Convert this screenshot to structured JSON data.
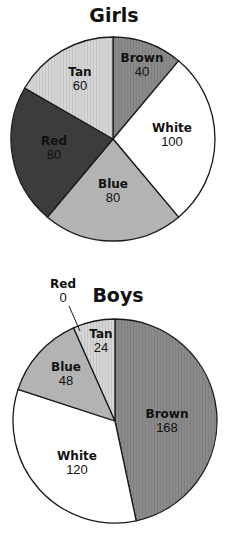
{
  "chart_data": [
    {
      "type": "pie",
      "title": "Girls",
      "start_angle_deg": 0,
      "direction": "clockwise",
      "categories": [
        "Brown",
        "White",
        "Blue",
        "Red",
        "Tan"
      ],
      "values": [
        40,
        100,
        80,
        80,
        60
      ],
      "colors": [
        "#8a8a8a",
        "#ffffff",
        "#b3b3b3",
        "#3c3c3c",
        "#d6d6d6"
      ],
      "geometry": {
        "cx": 113,
        "cy": 139,
        "r": 102,
        "title_x": 114,
        "title_y": 22
      },
      "labels": [
        {
          "name": "Brown",
          "value": "40",
          "x": 142,
          "y": 62
        },
        {
          "name": "White",
          "value": "100",
          "x": 172,
          "y": 132
        },
        {
          "name": "Blue",
          "value": "80",
          "x": 113,
          "y": 188
        },
        {
          "name": "Red",
          "value": "80",
          "x": 54,
          "y": 145
        },
        {
          "name": "Tan",
          "value": "60",
          "x": 80,
          "y": 76
        }
      ]
    },
    {
      "type": "pie",
      "title": "Boys",
      "start_angle_deg": 0,
      "direction": "clockwise",
      "categories": [
        "Brown",
        "White",
        "Blue",
        "Tan",
        "Red"
      ],
      "values": [
        168,
        120,
        48,
        24,
        0
      ],
      "colors": [
        "#8a8a8a",
        "#ffffff",
        "#b3b3b3",
        "#d6d6d6",
        "#3c3c3c"
      ],
      "geometry": {
        "cx": 115,
        "cy": 421,
        "r": 102,
        "title_x": 118,
        "title_y": 302
      },
      "labels": [
        {
          "name": "Brown",
          "value": "168",
          "x": 167,
          "y": 418
        },
        {
          "name": "White",
          "value": "120",
          "x": 77,
          "y": 460
        },
        {
          "name": "Blue",
          "value": "48",
          "x": 66,
          "y": 371
        },
        {
          "name": "Tan",
          "value": "24",
          "x": 101,
          "y": 338
        },
        {
          "name": "Red",
          "value": "0",
          "x": 63,
          "y": 288,
          "leader": [
            69,
            306,
            80,
            331
          ]
        }
      ]
    }
  ]
}
